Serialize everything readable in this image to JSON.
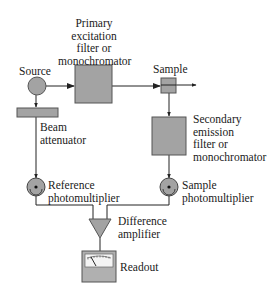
{
  "diagram": {
    "title": "",
    "colors": {
      "component_fill": "#a3a3a3",
      "component_stroke": "#555555",
      "line": "#222222",
      "background": "#ffffff"
    },
    "nodes": [
      {
        "id": "source",
        "label": "Source",
        "shape": "circle"
      },
      {
        "id": "primary_filter",
        "label": "Primary\nexcitation\nfilter or\nmonochromator",
        "shape": "box"
      },
      {
        "id": "sample",
        "label": "Sample",
        "shape": "small-box"
      },
      {
        "id": "beam_attenuator",
        "label": "Beam\nattenuator",
        "shape": "bar"
      },
      {
        "id": "secondary_filter",
        "label": "Secondary\nemission\nfilter or\nmonochromator",
        "shape": "box"
      },
      {
        "id": "reference_pmt",
        "label": "Reference\nphotomultiplier",
        "shape": "photomultiplier"
      },
      {
        "id": "sample_pmt",
        "label": "Sample\nphotomultiplier",
        "shape": "photomultiplier"
      },
      {
        "id": "difference_amplifier",
        "label": "Difference\namplifier",
        "shape": "triangle"
      },
      {
        "id": "readout",
        "label": "Readout",
        "shape": "meter"
      }
    ],
    "edges": [
      {
        "from": "source",
        "to": "primary_filter",
        "arrow": true
      },
      {
        "from": "primary_filter",
        "to": "sample",
        "arrow": true
      },
      {
        "from": "sample",
        "to": "out",
        "arrow": true
      },
      {
        "from": "source",
        "to": "beam_attenuator",
        "arrow": true
      },
      {
        "from": "beam_attenuator",
        "to": "reference_pmt",
        "arrow": true
      },
      {
        "from": "sample",
        "to": "secondary_filter",
        "arrow": true
      },
      {
        "from": "secondary_filter",
        "to": "sample_pmt",
        "arrow": true
      },
      {
        "from": "reference_pmt",
        "to": "difference_amplifier",
        "arrow": false
      },
      {
        "from": "sample_pmt",
        "to": "difference_amplifier",
        "arrow": false
      },
      {
        "from": "difference_amplifier",
        "to": "readout",
        "arrow": false
      }
    ]
  },
  "labels": {
    "source": "Source",
    "primary": "Primary\nexcitation\nfilter or\nmonochromator",
    "sample": "Sample",
    "beam": "Beam\nattenuator",
    "secondary": "Secondary\nemission\nfilter or\nmonochromator",
    "reference_pmt": "Reference\nphotomultiplier",
    "sample_pmt": "Sample\nphotomultiplier",
    "amplifier": "Difference\namplifier",
    "readout": "Readout"
  }
}
